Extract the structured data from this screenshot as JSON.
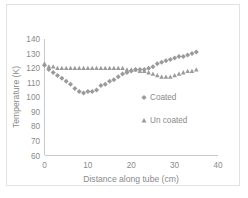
{
  "chart_data": {
    "type": "scatter",
    "title": "",
    "xlabel": "Distance along tube (cm)",
    "ylabel": "Temperature (K)",
    "xlim": [
      0,
      40
    ],
    "ylim": [
      60,
      140
    ],
    "xticks": [
      0,
      10,
      20,
      30,
      40
    ],
    "yticks": [
      60,
      70,
      80,
      90,
      100,
      110,
      120,
      130,
      140
    ],
    "xtick_labels": [
      "0",
      "10",
      "20",
      "30",
      "40"
    ],
    "ytick_labels": [
      "60",
      "70",
      "80",
      "90",
      "100",
      "110",
      "120",
      "130",
      "140"
    ],
    "grid": false,
    "legend_position": "inside-right",
    "series": [
      {
        "name": "Coated",
        "marker": "diamond",
        "color": "#9a9a9a",
        "x": [
          0,
          1,
          2,
          3,
          4,
          5,
          6,
          7,
          8,
          9,
          10,
          11,
          12,
          13,
          14,
          15,
          16,
          17,
          18,
          19,
          20,
          21,
          22,
          23,
          24,
          25,
          26,
          27,
          28,
          29,
          30,
          31,
          32,
          33,
          34,
          35
        ],
        "y": [
          122,
          119,
          117,
          115,
          113,
          111,
          109,
          106,
          104,
          103,
          104,
          104,
          105,
          108,
          109,
          111,
          112,
          114,
          116,
          117,
          118,
          119,
          119,
          119,
          120,
          121,
          123,
          124,
          125,
          126,
          127,
          128,
          128,
          129,
          130,
          131
        ]
      },
      {
        "name": "Un coated",
        "marker": "triangle",
        "color": "#9a9a9a",
        "x": [
          0,
          1,
          2,
          3,
          4,
          5,
          6,
          7,
          8,
          9,
          10,
          11,
          12,
          13,
          14,
          15,
          16,
          17,
          18,
          19,
          20,
          21,
          22,
          23,
          24,
          25,
          26,
          27,
          28,
          29,
          30,
          31,
          32,
          33,
          34,
          35
        ],
        "y": [
          123,
          121,
          121,
          120,
          120,
          120,
          120,
          120,
          120,
          120,
          120,
          120,
          120,
          120,
          120,
          120,
          120,
          120,
          120,
          119,
          119,
          119,
          118,
          118,
          117,
          116,
          115,
          114,
          114,
          114,
          115,
          116,
          117,
          118,
          118,
          119
        ]
      }
    ],
    "legend": [
      {
        "label": "Coated",
        "marker": "diamond"
      },
      {
        "label": "Un coated",
        "marker": "triangle"
      }
    ]
  }
}
